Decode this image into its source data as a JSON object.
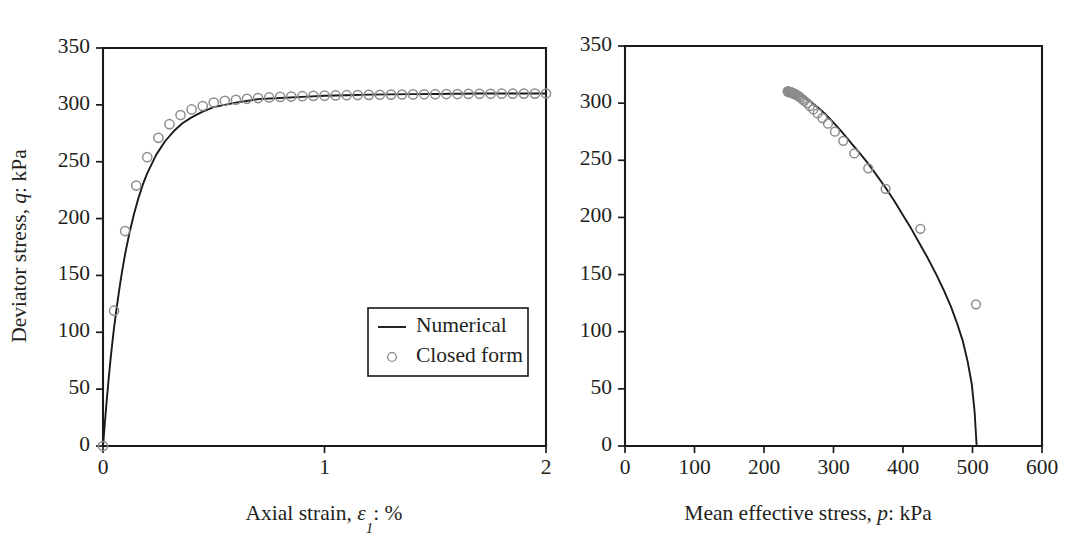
{
  "figure": {
    "background_color": "#ffffff",
    "ink_color": "#231f20",
    "marker_color": "#8d8d8d",
    "line_color": "#1a1a1a"
  },
  "legend": {
    "position": "inside-lower-right-of-left-panel",
    "entries": [
      {
        "label": "Numerical",
        "marker": "line"
      },
      {
        "label": "Closed form",
        "marker": "circle"
      }
    ]
  },
  "chart_data": [
    {
      "id": "stress-strain",
      "type": "line",
      "title": "",
      "xlabel": "Axial strain, ε1: %",
      "xlabel_parts": {
        "lead": "Axial strain, ",
        "symbol": "ε",
        "sub": "1",
        "tail": ": %"
      },
      "ylabel": "Deviator stress, q: kPa",
      "ylabel_parts": {
        "lead": "Deviator stress, ",
        "symbol": "q",
        "tail": ": kPa"
      },
      "xlim": [
        0,
        2
      ],
      "ylim": [
        0,
        350
      ],
      "xticks": [
        0,
        1,
        2
      ],
      "xtick_labels": [
        "0",
        "1",
        "2"
      ],
      "yticks": [
        0,
        50,
        100,
        150,
        200,
        250,
        300,
        350
      ],
      "ytick_labels": [
        "0",
        "50",
        "100",
        "150",
        "200",
        "250",
        "300",
        "350"
      ],
      "grid": false,
      "series": [
        {
          "name": "Numerical",
          "style": "line",
          "x": [
            0,
            0.005,
            0.01,
            0.015,
            0.02,
            0.025,
            0.03,
            0.035,
            0.04,
            0.045,
            0.05,
            0.06,
            0.07,
            0.08,
            0.09,
            0.1,
            0.12,
            0.14,
            0.16,
            0.18,
            0.2,
            0.24,
            0.28,
            0.32,
            0.36,
            0.4,
            0.45,
            0.5,
            0.55,
            0.6,
            0.7,
            0.8,
            0.9,
            1.0,
            1.1,
            1.2,
            1.3,
            1.4,
            1.5,
            1.6,
            1.7,
            1.8,
            1.9,
            2.0
          ],
          "y": [
            0,
            12,
            24,
            36,
            47,
            58,
            68,
            78,
            87,
            96,
            104,
            119,
            133,
            146,
            158,
            169,
            188,
            204,
            218,
            230,
            240,
            256,
            268,
            277,
            284,
            289,
            294,
            298,
            300,
            302,
            305,
            306,
            307,
            308,
            308.5,
            309,
            309.2,
            309.4,
            309.6,
            309.8,
            310,
            310,
            310,
            310
          ]
        },
        {
          "name": "Closed form",
          "style": "markers",
          "x": [
            0.0,
            0.05,
            0.1,
            0.15,
            0.2,
            0.25,
            0.3,
            0.35,
            0.4,
            0.45,
            0.5,
            0.55,
            0.6,
            0.65,
            0.7,
            0.75,
            0.8,
            0.85,
            0.9,
            0.95,
            1.0,
            1.05,
            1.1,
            1.15,
            1.2,
            1.25,
            1.3,
            1.35,
            1.4,
            1.45,
            1.5,
            1.55,
            1.6,
            1.65,
            1.7,
            1.75,
            1.8,
            1.85,
            1.9,
            1.95,
            2.0
          ],
          "y": [
            0,
            119,
            189,
            229,
            254,
            271,
            283,
            291,
            296,
            299,
            302,
            303.5,
            304.5,
            305.3,
            306,
            306.5,
            307,
            307.3,
            307.6,
            307.9,
            308.1,
            308.3,
            308.5,
            308.6,
            308.8,
            308.9,
            309.0,
            309.1,
            309.2,
            309.3,
            309.4,
            309.5,
            309.5,
            309.6,
            309.7,
            309.7,
            309.8,
            309.8,
            309.9,
            309.9,
            310
          ]
        }
      ]
    },
    {
      "id": "stress-path",
      "type": "line",
      "title": "",
      "xlabel": "Mean effective stress, p: kPa",
      "xlabel_parts": {
        "lead": "Mean effective stress, ",
        "symbol": "p",
        "tail": ": kPa"
      },
      "ylabel": "",
      "xlim": [
        0,
        600
      ],
      "ylim": [
        0,
        350
      ],
      "xticks": [
        0,
        100,
        200,
        300,
        400,
        500,
        600
      ],
      "xtick_labels": [
        "0",
        "100",
        "200",
        "300",
        "400",
        "500",
        "600"
      ],
      "yticks": [
        0,
        50,
        100,
        150,
        200,
        250,
        300,
        350
      ],
      "ytick_labels": [
        "0",
        "50",
        "100",
        "150",
        "200",
        "250",
        "300",
        "350"
      ],
      "grid": false,
      "series": [
        {
          "name": "Numerical",
          "style": "line",
          "x": [
            234,
            236,
            238,
            241,
            244,
            248,
            252,
            257,
            262,
            268,
            274,
            281,
            289,
            297,
            306,
            316,
            327,
            338,
            350,
            362,
            375,
            388,
            400,
            412,
            424,
            436,
            448,
            459,
            469,
            478,
            486,
            493,
            499,
            503,
            506
          ],
          "y": [
            310,
            310,
            309.8,
            309.5,
            309,
            308.2,
            307,
            305.5,
            303.5,
            301,
            298,
            294.5,
            290,
            285,
            279,
            272,
            264,
            256,
            247,
            237,
            226,
            214,
            202,
            190,
            177,
            164,
            150,
            136,
            122,
            107,
            92,
            74,
            54,
            30,
            0
          ]
        },
        {
          "name": "Closed form",
          "style": "markers",
          "x": [
            234,
            234.5,
            235,
            235.5,
            236,
            236.5,
            237,
            237.5,
            238,
            238.5,
            239,
            239.5,
            240,
            240.5,
            241,
            242,
            243,
            244,
            245,
            246,
            248,
            250,
            252,
            255,
            258,
            262,
            266,
            271,
            277,
            284,
            292,
            302,
            314,
            330,
            350,
            375,
            425,
            505
          ],
          "y": [
            310.3,
            310.2,
            310.1,
            310,
            309.9,
            309.8,
            309.7,
            309.6,
            309.5,
            309.4,
            309.3,
            309.2,
            309.1,
            309,
            308.9,
            308.6,
            308.3,
            308,
            307.7,
            307.4,
            306.8,
            306,
            305,
            303.6,
            302,
            300,
            297.5,
            294.5,
            291,
            287,
            282,
            275,
            267,
            256,
            243,
            225,
            190,
            124
          ]
        }
      ]
    }
  ]
}
